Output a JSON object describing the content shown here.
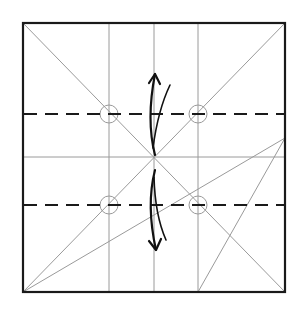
{
  "diagram": {
    "type": "origami-fold-diagram",
    "colors": {
      "background": "#ffffff",
      "border": "#1a1a1a",
      "crease": "#9a9a9a",
      "valley_fold": "#1a1a1a",
      "arrow": "#111111"
    },
    "square": {
      "x1": 23,
      "y1": 23,
      "x2": 285,
      "y2": 292
    },
    "vertical_creases_x": [
      109,
      154,
      198
    ],
    "horizontal_creases_y": [
      157
    ],
    "valley_folds_y": [
      114,
      205
    ],
    "diagonals": [
      {
        "from": [
          23,
          23
        ],
        "to": [
          285,
          292
        ]
      },
      {
        "from": [
          285,
          23
        ],
        "to": [
          23,
          292
        ]
      },
      {
        "from": [
          23,
          292
        ],
        "to": [
          285,
          138
        ]
      },
      {
        "from": [
          198,
          292
        ],
        "to": [
          285,
          138
        ]
      }
    ],
    "reference_circles": [
      {
        "cx": 109,
        "cy": 114,
        "r": 9
      },
      {
        "cx": 198,
        "cy": 114,
        "r": 9
      },
      {
        "cx": 109,
        "cy": 205,
        "r": 9
      },
      {
        "cx": 198,
        "cy": 205,
        "r": 9
      }
    ],
    "arrows": [
      {
        "name": "fold-up-arrow",
        "direction": "up"
      },
      {
        "name": "fold-down-arrow",
        "direction": "down"
      }
    ]
  }
}
